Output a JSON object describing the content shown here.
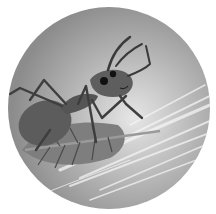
{
  "image": {
    "subject": "ant-on-leaf-illustration",
    "style": "grayscale circular vignette",
    "colors": {
      "background": "#ffffff",
      "disc_light": "#d6d6d6",
      "disc_mid": "#a8a8a8",
      "disc_dark": "#8a8a8a",
      "ant_body": "#5a5a5a",
      "ant_dark": "#3a3a3a",
      "leaf": "#7a7a7a",
      "leaf_vein": "#4a4a4a",
      "eye": "#111111",
      "streak": "#f0f0f0"
    }
  }
}
